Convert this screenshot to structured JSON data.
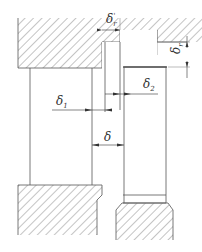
{
  "diagram": {
    "type": "engineering cross-section (clearance dimensions)",
    "colors": {
      "line": "#555555",
      "hatch": "#8a8a8a",
      "background": "#ffffff"
    },
    "labels": {
      "delta_r_prime": {
        "symbol": "δ",
        "sub": "r",
        "sup": "'"
      },
      "delta_r": {
        "symbol": "δ",
        "sub": "r"
      },
      "delta_1": {
        "symbol": "δ",
        "sub": "1"
      },
      "delta_2": {
        "symbol": "δ",
        "sub": "2"
      },
      "delta": {
        "symbol": "δ"
      }
    },
    "parts": [
      "top-hatched-housing",
      "left-tube",
      "right-tube",
      "bottom-left-hatched-block",
      "bottom-right-hatched-block"
    ]
  }
}
